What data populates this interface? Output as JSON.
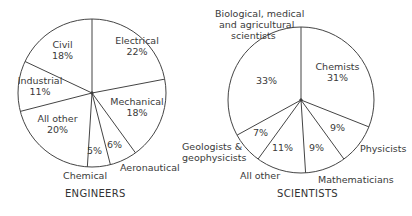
{
  "chart_data": [
    {
      "type": "pie",
      "title": "ENGINEERS",
      "categories": [
        "Electrical",
        "Mechanical",
        "Aeronautical",
        "Chemical",
        "All other",
        "Industrial",
        "Civil"
      ],
      "values": [
        22,
        18,
        6,
        5,
        20,
        11,
        18
      ],
      "value_labels": [
        "22%",
        "18%",
        "6%",
        "5%",
        "20%",
        "11%",
        "18%"
      ],
      "unit": "%"
    },
    {
      "type": "pie",
      "title": "SCIENTISTS",
      "categories": [
        "Chemists",
        "Physicists",
        "Mathematicians",
        "All other",
        "Geologists & geophysicists",
        "Biological, medical and agricultural scientists"
      ],
      "values": [
        31,
        9,
        9,
        11,
        7,
        33
      ],
      "value_labels": [
        "31%",
        "9%",
        "9%",
        "11%",
        "7%",
        "33%"
      ],
      "unit": "%"
    }
  ],
  "engineers": {
    "title": "ENGINEERS",
    "electrical": {
      "name": "Electrical",
      "pct": "22%"
    },
    "mechanical": {
      "name": "Mechanical",
      "pct": "18%"
    },
    "aeronautical": {
      "name": "Aeronautical",
      "pct": "6%"
    },
    "chemical": {
      "name": "Chemical",
      "pct": "5%"
    },
    "all_other": {
      "name": "All other",
      "pct": "20%"
    },
    "industrial": {
      "name": "Industrial",
      "pct": "11%"
    },
    "civil": {
      "name": "Civil",
      "pct": "18%"
    }
  },
  "scientists": {
    "title": "SCIENTISTS",
    "chemists": {
      "name": "Chemists",
      "pct": "31%"
    },
    "physicists": {
      "name": "Physicists",
      "pct": "9%"
    },
    "mathematicians": {
      "name": "Mathematicians",
      "pct": "9%"
    },
    "all_other": {
      "name": "All other",
      "pct": "11%"
    },
    "geologists": {
      "name1": "Geologists &",
      "name2": "geophysicists",
      "pct": "7%"
    },
    "bio": {
      "name1": "Biological, medical",
      "name2": "and agricultural",
      "name3": "scientists",
      "pct": "33%"
    }
  }
}
